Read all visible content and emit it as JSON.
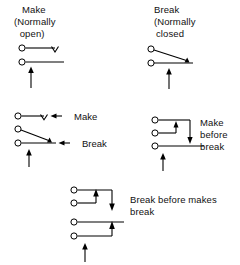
{
  "diagram": {
    "background_color": "#ffffff",
    "line_color": "#000000",
    "figures": [
      {
        "id": "make-normally-open",
        "caption_lines": [
          "Make",
          "(Normally",
          " open)"
        ],
        "caption_text": "Make (Normally open)",
        "terminals": 2,
        "actuator": "up-arrow",
        "contact_marker": "open-v",
        "description": "Normally open make contact, actuated from below"
      },
      {
        "id": "break-normally-closed",
        "caption_lines": [
          "Break",
          "(Normally",
          "closed"
        ],
        "caption_text": "Break (Normally closed",
        "terminals": 2,
        "actuator": "up-arrow",
        "contact_marker": "solid-triangle",
        "description": "Normally closed break contact, actuated from below"
      },
      {
        "id": "make-break-changeover",
        "caption_text": "",
        "terminals": 3,
        "actuator": "up-arrow",
        "inline_labels": [
          "Make",
          "Break"
        ],
        "description": "Changeover contact with make and break callouts"
      },
      {
        "id": "make-before-break",
        "caption_lines": [
          "Make",
          "before",
          "break"
        ],
        "caption_text": "Make before break",
        "terminals": 3,
        "actuator": "up-arrow",
        "description": "Make-before-break changeover contact"
      },
      {
        "id": "break-before-makes-break",
        "caption_lines": [
          "Break before makes",
          "break"
        ],
        "caption_text": "Break before makes break",
        "terminals": 4,
        "actuator": "up-arrow",
        "description": "Break before makes break multi-contact arrangement"
      }
    ],
    "inline_label_make": "Make",
    "inline_label_break": "Break"
  }
}
